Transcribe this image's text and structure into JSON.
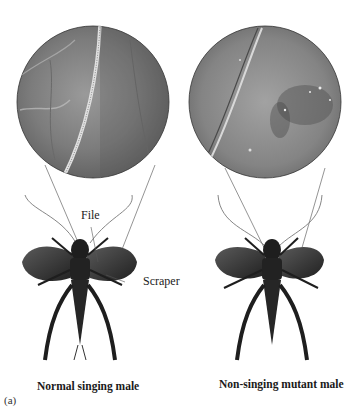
{
  "figure": {
    "panel_label": "(a)",
    "left": {
      "caption": "Normal singing male",
      "labels": {
        "file": "File",
        "scraper": "Scraper"
      },
      "inset": "magnified view of file (ridged vein) on wing"
    },
    "right": {
      "caption": "Non-singing mutant male",
      "inset": "magnified view of wing lacking file structure"
    }
  },
  "colors": {
    "background": "#ffffff",
    "inset_fill": "#8a8a8a",
    "inset_dark": "#5a5a5a",
    "cricket_body": "#1e1e1e",
    "wing": "#3a3a3a",
    "line": "#555555"
  }
}
